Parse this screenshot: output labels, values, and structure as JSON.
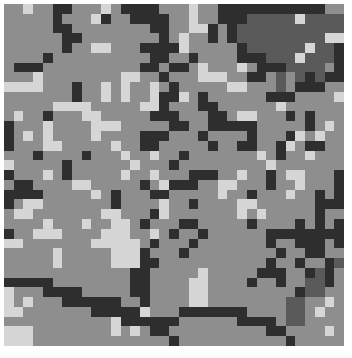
{
  "image": {
    "description": "Pixelated grayscale mosaic texture",
    "grid_cols": 35,
    "grid_rows": 35,
    "palette": {
      "L": "#d6d6d6",
      "M": "#8e8e8e",
      "S": "#5a5a5a",
      "D": "#2e2e2e"
    },
    "rows": [
      "MMLMMDDMMMLMDDDDMMMLMMDDDDDDDDDDDMM",
      "MMMMMDMMMLDMMDDDDMMLMMDDDSSSSSLSSSS",
      "MMMMMDDMMMMMMMMDDMMLLDMDSSSSSSSSSSS",
      "MMMMMMDDMMMMMMMMDMLMMDMDSSSSSSSSSLL",
      "MMMMMMDMMLLMMMDDDDLMMMMMDSSSSSSLSSD",
      "MMMMDMMMMMMMMMMDDMMDMMMMDDDSSSLSSSD",
      "MDDDMMMMMMMMMMDDMDDMLMMMLMDDDSSSSMD",
      "MMMLMMMMMMMMLLMMDMMMLLLMMDDMSMSDSDD",
      "LLLLMMMDMMLMLMMLMDMMMMMLLMMMSMDDDMM",
      "MMMMMMMDMMLMLMMLDDLMDMMMMMMDDDMMMML",
      "MMMMMLLLLMMMMMLLDMMMDDMMMMMMLMMMMMM",
      "MLMMDMMMLLMMMMMDDDMMMDDMLLMMMDMDMMM",
      "DMMMLMMMMLLLMMMMMDDMMDDDDDMMMMMDMLM",
      "DMLMLMMMMLMMMMDDDMMMDMMMMDMMMDLMLMM",
      "DMMMLLMMMMMLMMDDMMMMMDMMDDMMDLMDDMM",
      "MMMDMMMMDMMMLMMLMMDMMMMMMMLMDMMLMMM",
      "LMMMMMDMMMMMMLMMMDMMMMMMMMMLMMMMMMM",
      "DMMMLMDMMMMMLMMLMMMDDDMMLMMDMLLMMMD",
      "MDDMMMMLLMMMMMDMLDDDMMLLMMMDMMLMMMD",
      "DDDDMMMMMLMDMMMDDMMMMMLMMDMMMLMMDMD",
      "DMLLMMMMMMMDMMMMLMMDMMMMLLMMMMMMDDD",
      "MLLMMMMMMMLLMMMDLMMMMMMMLMLMMMMMDMM",
      "MMMMLMMMLMMLLMDMMMDDMMMMMDMMMMDMDMD",
      "DMMLLLMMMMLLLMMLMDMMDMMMMMMDDDDDDDD",
      "LLMMMMMMMLLLLLMDMMMDMMMMMMMDMMDDDMD",
      "MMMMMLMMMMMLLLDMMMDMMMMMMMMMDMMDDMM",
      "MMMMMLMMMMMLLLDDMMMMMMMMMMMDMMDMMDS",
      "MMMMMMMMMMMMMDDMMMMMLMMMMMDDDMMDSDM",
      "DDDDDMMMMMMMMDDMMMMLLMMMMDMMDMMSSDM",
      "LMMMDDDDMMMMMDDMMMMLLMMMMMMMMMDSSMM",
      "LMLMMMDDDDDDMMDMMMMLLMMMMMMMMSSMMLM",
      "LLMMMMMMMDDDDDLMMMDDDDDDDMMMMSSMLMM",
      "MMMMMMMMMMMLDDDDDDMMMMMMDDDDMSSMMMM",
      "LLLMMMMMMMMLMLMDDMMMMMMMMMMDDMMMMLM",
      "LLLMMMMMMMMMMMMMMDMMMMMMMMMMMDMMMMM"
    ]
  }
}
